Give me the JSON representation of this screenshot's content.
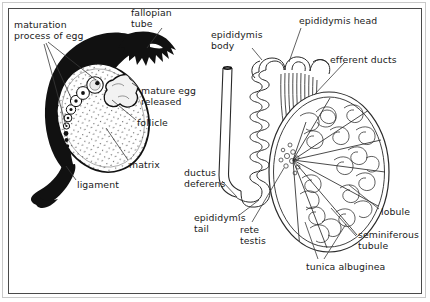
{
  "figure": {
    "panels": [
      {
        "id": "ovary",
        "name": "ovary-follicle-maturation-diagram",
        "labels": [
          {
            "id": "maturation",
            "text": "maturation\nprocess of egg",
            "x": 14,
            "y": 20
          },
          {
            "id": "fallopian_tube",
            "text": "fallopian\ntube",
            "x": 131,
            "y": 8
          },
          {
            "id": "mature_egg",
            "text": "mature egg\nreleased",
            "x": 141,
            "y": 86
          },
          {
            "id": "follicle",
            "text": "follicle",
            "x": 137,
            "y": 118
          },
          {
            "id": "matrix",
            "text": "matrix",
            "x": 129,
            "y": 160
          },
          {
            "id": "ligament",
            "text": "ligament",
            "x": 77,
            "y": 180
          }
        ]
      },
      {
        "id": "testis",
        "name": "testis-epididymis-diagram",
        "labels": [
          {
            "id": "epididymis_body",
            "text": "epididymis\nbody",
            "x": 211,
            "y": 30
          },
          {
            "id": "epididymis_head",
            "text": "epididymis head",
            "x": 299,
            "y": 16
          },
          {
            "id": "efferent_ducts",
            "text": "efferent ducts",
            "x": 330,
            "y": 55
          },
          {
            "id": "ductus_deferens",
            "text": "ductus\ndeferens",
            "x": 184,
            "y": 168
          },
          {
            "id": "epididymis_tail",
            "text": "epididymis\ntail",
            "x": 194,
            "y": 213
          },
          {
            "id": "rete_testis",
            "text": "rete\ntestis",
            "x": 240,
            "y": 225
          },
          {
            "id": "lobule",
            "text": "lobule",
            "x": 381,
            "y": 207
          },
          {
            "id": "seminiferous_tubule",
            "text": "seminiferous\ntubule",
            "x": 358,
            "y": 230
          },
          {
            "id": "tunica_albuginea",
            "text": "tunica albuginea",
            "x": 306,
            "y": 262
          }
        ]
      }
    ],
    "colors": {
      "ink": "#1a1a1a",
      "leader_line": "#3a3a3a",
      "fill_solid": "#111111",
      "frame": "#4a4a4a",
      "outer_rule": "#c9c9c9",
      "background": "#ffffff"
    }
  }
}
